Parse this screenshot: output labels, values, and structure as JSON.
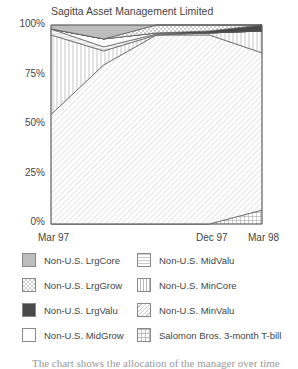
{
  "chart_data": {
    "type": "area",
    "stacked": true,
    "percent": true,
    "title": "Sagitta Asset Management Limited",
    "xlabel": "",
    "ylabel": "",
    "ylim": [
      0,
      100
    ],
    "yticks": [
      "0%",
      "25%",
      "50%",
      "75%",
      "100%"
    ],
    "x": [
      "Mar 97",
      "Jun 97",
      "Sep 97",
      "Dec 97",
      "Mar 98"
    ],
    "xtick_labels": [
      "Mar 97",
      "Dec 97",
      "Mar 98"
    ],
    "grid": false,
    "legend_position": "bottom",
    "series": [
      {
        "name": "Salomon Bros. 3-month T-bill",
        "values": [
          0,
          0,
          0,
          0,
          7
        ]
      },
      {
        "name": "Non-U.S. MinValu",
        "values": [
          55,
          80,
          95,
          95,
          79
        ]
      },
      {
        "name": "Non-U.S. MinCore",
        "values": [
          40,
          7,
          0,
          1,
          11
        ]
      },
      {
        "name": "Non-U.S. MidValu",
        "values": [
          3,
          2,
          0.5,
          0,
          0
        ]
      },
      {
        "name": "Non-U.S. MidGrow",
        "values": [
          0,
          4,
          0.5,
          0,
          0
        ]
      },
      {
        "name": "Non-U.S. LrgValu",
        "values": [
          0,
          0,
          0,
          1,
          3
        ]
      },
      {
        "name": "Non-U.S. LrgGrow",
        "values": [
          0,
          0,
          4,
          3,
          0
        ]
      },
      {
        "name": "Non-U.S. LrgCore",
        "values": [
          2,
          7,
          0,
          0,
          0
        ]
      }
    ]
  },
  "legend": {
    "items": [
      {
        "label": "Non-U.S. LrgCore",
        "pattern": "lrgcore"
      },
      {
        "label": "Non-U.S. LrgGrow",
        "pattern": "lrggrow"
      },
      {
        "label": "Non-U.S. LrgValu",
        "pattern": "lrgvalu"
      },
      {
        "label": "Non-U.S. MidGrow",
        "pattern": "midgrow"
      },
      {
        "label": "Non-U.S. MidValu",
        "pattern": "midvalu"
      },
      {
        "label": "Non-U.S. MinCore",
        "pattern": "mincore"
      },
      {
        "label": "Non-U.S. MinValu",
        "pattern": "minvalu"
      },
      {
        "label": "Salomon Bros. 3-month T-bill",
        "pattern": "tbill"
      }
    ]
  },
  "colors": {
    "lrgcore": "#bdbdbd",
    "lrgvalu": "#4a4a4a",
    "outline": "#555555"
  },
  "footer": {
    "text": "The chart shows the allocation of the manager over time"
  }
}
